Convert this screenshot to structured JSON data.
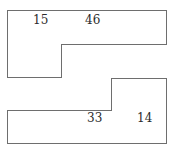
{
  "figure": {
    "background_color": "#ffffff",
    "stroke_color": "#6e6e6e",
    "text_color": "#2b2b2b",
    "width": 173,
    "height": 154
  },
  "shapes": {
    "top": {
      "name": "top-step-polygon",
      "points": "7,10 166,10 166,44 61,44 61,77 7,77",
      "labels": [
        {
          "id": "label-15",
          "value": "15"
        },
        {
          "id": "label-46",
          "value": "46"
        }
      ]
    },
    "bottom": {
      "name": "bottom-step-polygon",
      "points": "7,110 111,110 111,78 166,78 166,143 7,143",
      "labels": [
        {
          "id": "label-33",
          "value": "33"
        },
        {
          "id": "label-14",
          "value": "14"
        }
      ]
    }
  },
  "labels": {
    "top_left": "15",
    "top_right": "46",
    "bottom_left": "33",
    "bottom_right": "14"
  }
}
